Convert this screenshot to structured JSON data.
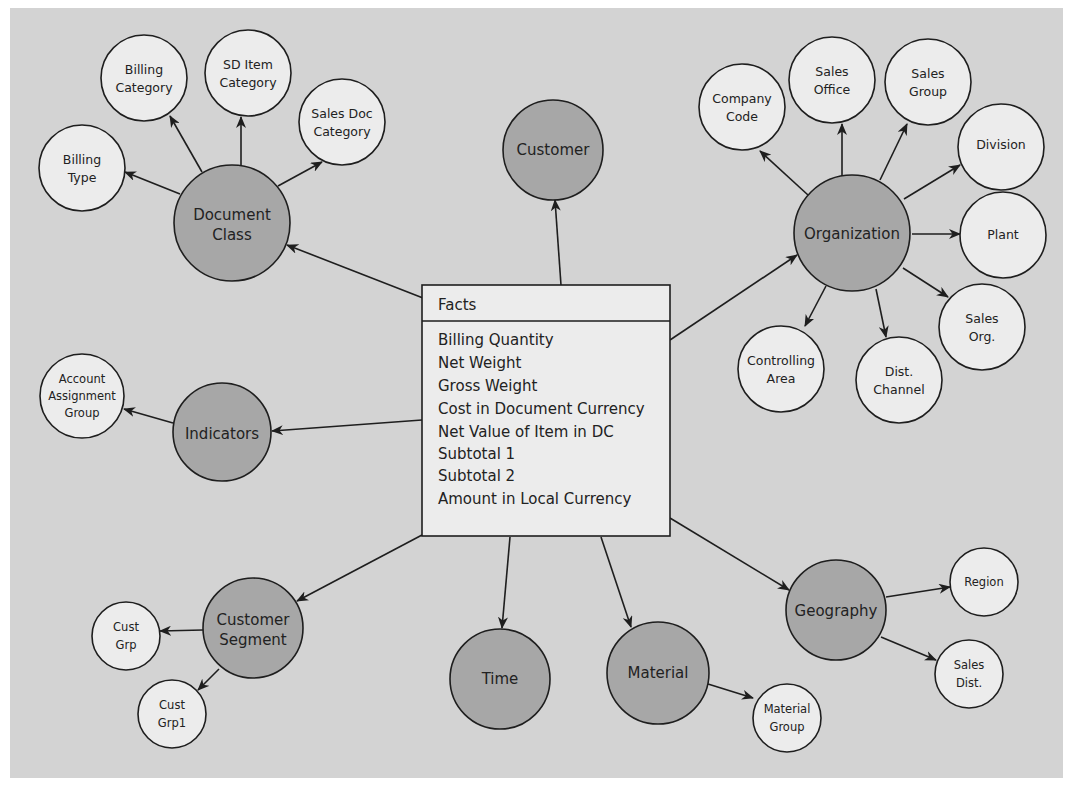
{
  "diagram": {
    "colors": {
      "background": "#d3d3d3",
      "dimension_fill": "#a7a7a7",
      "attribute_fill": "#ececec",
      "stroke": "#1e1e1e"
    },
    "facts": {
      "title": "Facts",
      "items": [
        "Billing Quantity",
        "Net Weight",
        "Gross Weight",
        "Cost in Document Currency",
        "Net Value of Item in DC",
        "Subtotal 1",
        "Subtotal 2",
        "Amount in Local Currency"
      ]
    },
    "dimensions": {
      "document_class": {
        "label": [
          "Document",
          "Class"
        ],
        "attributes": {
          "billing_type": [
            "Billing",
            "Type"
          ],
          "billing_category": [
            "Billing",
            "Category"
          ],
          "sd_item_category": [
            "SD Item",
            "Category"
          ],
          "sales_doc_category": [
            "Sales Doc",
            "Category"
          ]
        }
      },
      "customer": {
        "label": [
          "Customer"
        ]
      },
      "organization": {
        "label": [
          "Organization"
        ],
        "attributes": {
          "company_code": [
            "Company",
            "Code"
          ],
          "sales_office": [
            "Sales",
            "Office"
          ],
          "sales_group": [
            "Sales",
            "Group"
          ],
          "division": [
            "Division"
          ],
          "plant": [
            "Plant"
          ],
          "sales_org": [
            "Sales",
            "Org."
          ],
          "dist_channel": [
            "Dist.",
            "Channel"
          ],
          "controlling_area": [
            "Controlling",
            "Area"
          ]
        }
      },
      "indicators": {
        "label": [
          "Indicators"
        ],
        "attributes": {
          "account_assignment_group": [
            "Account",
            "Assignment",
            "Group"
          ]
        }
      },
      "customer_segment": {
        "label": [
          "Customer",
          "Segment"
        ],
        "attributes": {
          "cust_grp": [
            "Cust",
            "Grp"
          ],
          "cust_grp1": [
            "Cust",
            "Grp1"
          ]
        }
      },
      "time": {
        "label": [
          "Time"
        ]
      },
      "material": {
        "label": [
          "Material"
        ],
        "attributes": {
          "material_group": [
            "Material",
            "Group"
          ]
        }
      },
      "geography": {
        "label": [
          "Geography"
        ],
        "attributes": {
          "region": [
            "Region"
          ],
          "sales_dist": [
            "Sales",
            "Dist."
          ]
        }
      }
    }
  }
}
